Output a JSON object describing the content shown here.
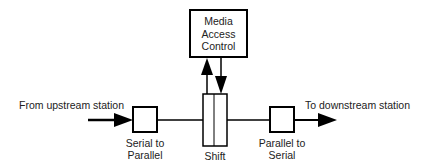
{
  "diagram": {
    "nodes": {
      "mac": {
        "label_lines": [
          "Media",
          "Access",
          "Control"
        ]
      },
      "serial_to_parallel": {
        "label_lines": [
          "Serial to",
          "Parallel"
        ]
      },
      "shift": {
        "label": "Shift"
      },
      "parallel_to_serial": {
        "label_lines": [
          "Parallel to",
          "Serial"
        ]
      }
    },
    "edges": {
      "input": {
        "label": "From upstream station"
      },
      "output": {
        "label": "To downstream station"
      }
    },
    "colors": {
      "stroke": "#000000",
      "background": "#ffffff",
      "text": "#222222"
    }
  }
}
